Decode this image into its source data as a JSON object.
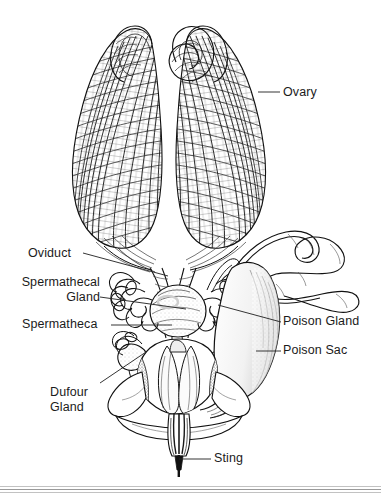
{
  "figure": {
    "style": "pen-and-ink scientific illustration",
    "background_color": "#ffffff",
    "ink_color": "#1b1b1b",
    "width": 381,
    "height": 499
  },
  "labels": [
    {
      "id": "ovary",
      "text": "Ovary",
      "x": 283,
      "y": 86,
      "align": "left",
      "leader": {
        "x1": 258,
        "y1": 92,
        "x2": 280,
        "y2": 92
      }
    },
    {
      "id": "oviduct",
      "text": "Oviduct",
      "x": 28,
      "y": 247,
      "align": "left",
      "leader": {
        "x1": 83,
        "y1": 253,
        "x2": 168,
        "y2": 276
      }
    },
    {
      "id": "spermathecal-gland",
      "line1": "Spermathecal",
      "line2": "Gland",
      "x": 18,
      "y": 275,
      "align": "right",
      "leader": {
        "x1": 100,
        "y1": 297,
        "x2": 186,
        "y2": 309
      }
    },
    {
      "id": "spermatheca",
      "text": "Spermatheca",
      "x": 22,
      "y": 318,
      "align": "left",
      "leader": {
        "x1": 111,
        "y1": 325,
        "x2": 172,
        "y2": 325
      }
    },
    {
      "id": "dufour-gland",
      "line1": "Dufour",
      "line2": "Gland",
      "x": 50,
      "y": 385,
      "align": "left",
      "leader": {
        "x1": 100,
        "y1": 383,
        "x2": 146,
        "y2": 352
      }
    },
    {
      "id": "poison-gland",
      "text": "Poison Gland",
      "x": 283,
      "y": 315,
      "align": "left",
      "leader": {
        "x1": 218,
        "y1": 305,
        "x2": 281,
        "y2": 322
      }
    },
    {
      "id": "poison-sac",
      "text": "Poison Sac",
      "x": 283,
      "y": 344,
      "align": "left",
      "leader": {
        "x1": 256,
        "y1": 351,
        "x2": 281,
        "y2": 351
      }
    },
    {
      "id": "sting",
      "text": "Sting",
      "x": 214,
      "y": 452,
      "align": "left",
      "leader": {
        "x1": 179,
        "y1": 459,
        "x2": 211,
        "y2": 459
      }
    }
  ],
  "footer_rules": [
    {
      "y": 486,
      "shade": "#c2c2c2"
    },
    {
      "y": 489,
      "shade": "#8d8d8d"
    },
    {
      "y": 492,
      "shade": "#b5b5b5"
    }
  ],
  "anatomy_parts": [
    "left ovary",
    "right ovary",
    "lateral oviduct",
    "median oviduct",
    "spermatheca",
    "spermathecal gland",
    "Dufour gland",
    "poison gland (convoluted tubule)",
    "poison sac",
    "sting bulb",
    "sting shaft / stylet"
  ]
}
